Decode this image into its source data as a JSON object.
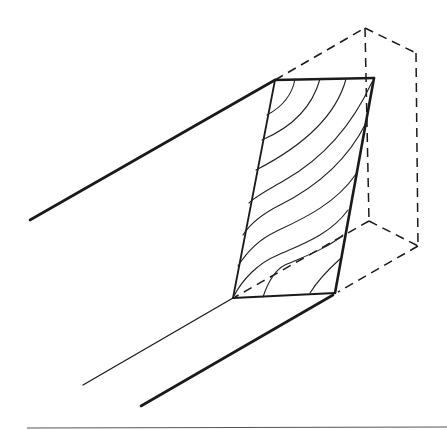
{
  "figure": {
    "colors": {
      "ink": "#1a1a1a",
      "background": "#ffffff",
      "rule": "#555555"
    },
    "board_face": {
      "corners": [
        [
          275,
          80
        ],
        [
          374,
          78
        ],
        [
          335,
          293
        ],
        [
          233,
          298
        ]
      ]
    },
    "edges": {
      "upper_left_edge": [
        [
          30,
          220
        ],
        [
          275,
          80
        ]
      ],
      "lower_thin_edge": [
        [
          83,
          385
        ],
        [
          233,
          298
        ]
      ],
      "lower_thick_edge": [
        [
          141,
          406
        ],
        [
          333,
          295
        ]
      ]
    },
    "dashed_box": {
      "apex": [
        365,
        28
      ],
      "right_top": [
        416,
        53
      ],
      "right_bottom": [
        418,
        246
      ],
      "inner_bottom": [
        369,
        221
      ]
    },
    "grain_lines_count": 10,
    "bottom_rule": {
      "y": 428,
      "x_start": 27,
      "x_end": 447
    }
  }
}
